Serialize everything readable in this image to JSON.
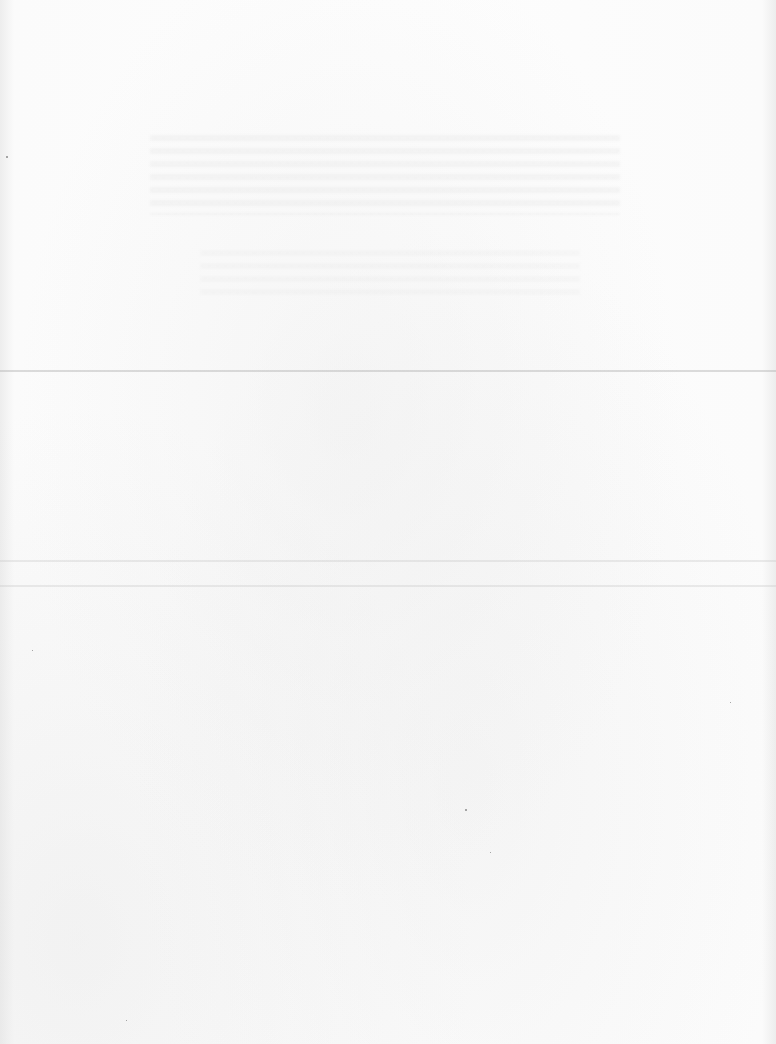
{
  "document": {
    "type": "blank-scanned-page",
    "text_content": [],
    "legible_text": false,
    "background_color": "#fcfcfc",
    "fold_lines": [
      {
        "id": "fold-line-1",
        "y": 370,
        "strength": "medium"
      },
      {
        "id": "fold-line-2",
        "y": 560,
        "strength": "faint"
      },
      {
        "id": "fold-line-3",
        "y": 585,
        "strength": "faint"
      }
    ],
    "bleed_through_regions": [
      {
        "x": 150,
        "y": 135,
        "width": 470,
        "height": 80
      },
      {
        "x": 200,
        "y": 250,
        "width": 380,
        "height": 50
      }
    ]
  }
}
